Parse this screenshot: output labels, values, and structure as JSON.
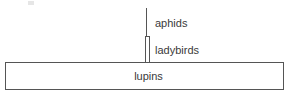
{
  "diagram": {
    "type": "pyramid of numbers",
    "levels": [
      {
        "name": "aphids",
        "label": "aphids",
        "relative_width": "line"
      },
      {
        "name": "ladybirds",
        "label": "ladybirds",
        "relative_width": "narrow"
      },
      {
        "name": "lupins",
        "label": "lupins",
        "relative_width": "wide"
      }
    ]
  },
  "colors": {
    "line": "#555555",
    "text": "#3a3a3a",
    "background": "#ffffff"
  }
}
